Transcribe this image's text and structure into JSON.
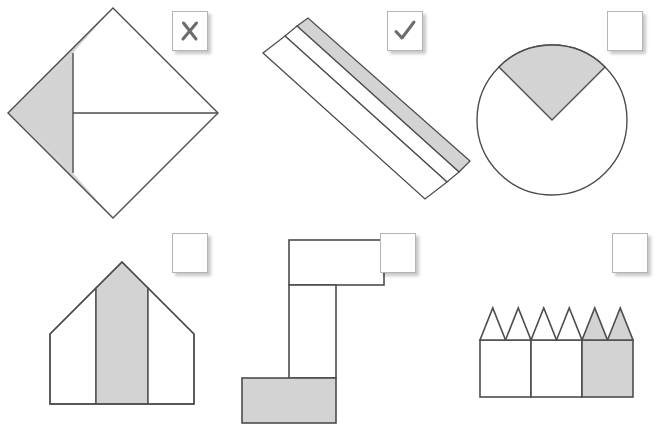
{
  "page": {
    "background_color": "#ffffff",
    "width": 667,
    "height": 426
  },
  "style": {
    "shape_fill": "#d3d3d3",
    "shape_stroke": "#4d4d4d",
    "shape_white": "#ffffff",
    "checkbox_border": "#b4b4b4",
    "checkbox_background": "#ffffff",
    "mark_color": "#6b6b6b"
  },
  "items": [
    {
      "id": "diamond-with-triangle",
      "shape_name": "diamond-divided-shape",
      "description": "Diamond (rotated square) split by a vertical and a horizontal chord; left region shaded grey",
      "shaded_part": "left quadrilateral",
      "checkbox": {
        "state": "cross",
        "mark": "x-mark-icon",
        "label": "X"
      }
    },
    {
      "id": "diagonal-striped-bar",
      "shape_name": "diagonal-striped-bar-shape",
      "description": "Long diagonal rectangular bar divided into three lengthwise strips; upper strip shaded grey",
      "shaded_part": "upper lengthwise strip",
      "checkbox": {
        "state": "check",
        "mark": "check-mark-icon",
        "label": "✓"
      }
    },
    {
      "id": "circle-with-sector",
      "shape_name": "circle-sector-shape",
      "description": "Circle with a 90 degree sector at the top shaded grey",
      "shaded_part": "top sector",
      "checkbox": {
        "state": "empty",
        "mark": "empty-checkbox",
        "label": ""
      }
    },
    {
      "id": "house-with-stripe",
      "shape_name": "house-pentagon-shape",
      "description": "House / pentagon shape divided into three vertical bands; middle band shaded grey",
      "shaded_part": "middle vertical band",
      "checkbox": {
        "state": "empty",
        "mark": "empty-checkbox",
        "label": ""
      }
    },
    {
      "id": "z-block-shape",
      "shape_name": "z-block-shape",
      "description": "Z / S shaped block made of a top rectangle, a vertical stem and a bottom rectangle; bottom rectangle shaded grey",
      "shaded_part": "bottom rectangle",
      "checkbox": {
        "state": "empty",
        "mark": "empty-checkbox",
        "label": ""
      }
    },
    {
      "id": "crown-zigzag-shape",
      "shape_name": "crown-zigzag-shape",
      "description": "Row of three squares topped by six triangles forming a zigzag crown; right square and its two triangles shaded grey",
      "shaded_part": "right square with its two triangles",
      "checkbox": {
        "state": "empty",
        "mark": "empty-checkbox",
        "label": ""
      }
    }
  ]
}
